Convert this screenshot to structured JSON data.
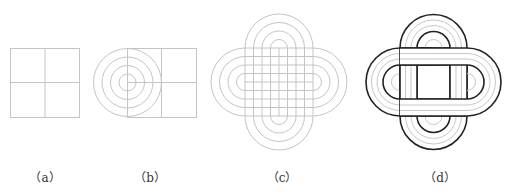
{
  "figures": [
    {
      "id": "a",
      "caption": "（a）",
      "description": "square divided into four quadrants"
    },
    {
      "id": "b",
      "caption": "（b）",
      "description": "concentric circles centered on left edge of divided rectangle"
    },
    {
      "id": "c",
      "caption": "（c）",
      "description": "overlapping stadium construction grid"
    },
    {
      "id": "d",
      "caption": "（d）",
      "description": "interlaced four-loop knot"
    }
  ],
  "colors": {
    "guide_line": "#bdbdbd",
    "outline": "#222222",
    "background": "#ffffff"
  }
}
